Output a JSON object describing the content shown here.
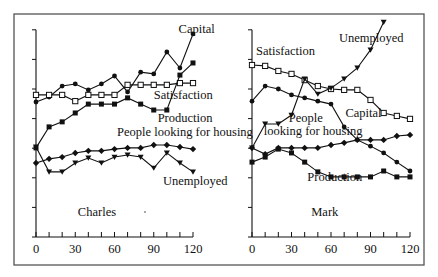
{
  "chart_data": [
    {
      "type": "line",
      "title": "Charles",
      "xlabel": "",
      "ylabel": "",
      "x": [
        0,
        10,
        20,
        30,
        40,
        50,
        60,
        70,
        80,
        90,
        100,
        110,
        120
      ],
      "x_tick_labels": [
        "0",
        "30",
        "60",
        "90",
        "120"
      ],
      "x_tick_values": [
        0,
        30,
        60,
        90,
        120
      ],
      "xlim": [
        0,
        120
      ],
      "ylim": [
        0,
        7
      ],
      "y_tick_labels": [],
      "grid": false,
      "legend": "inline labels",
      "series": [
        {
          "name": "Capital",
          "marker": "filled-circle",
          "values": [
            4.56,
            4.73,
            5.1,
            5.17,
            4.97,
            5.17,
            5.44,
            4.9,
            5.57,
            5.51,
            6.25,
            5.71,
            6.86
          ]
        },
        {
          "name": "Satisfaction",
          "marker": "open-square",
          "values": [
            4.8,
            4.8,
            4.8,
            4.59,
            4.8,
            4.8,
            4.8,
            5.14,
            5.14,
            5.14,
            5.14,
            5.2,
            5.2
          ]
        },
        {
          "name": "Production",
          "marker": "filled-square",
          "values": [
            3.01,
            3.72,
            3.89,
            4.19,
            4.49,
            4.49,
            4.49,
            4.7,
            4.49,
            4.29,
            4.29,
            5.47,
            5.88
          ]
        },
        {
          "name": "People looking for housing",
          "marker": "filled-diamond",
          "values": [
            2.5,
            2.64,
            2.7,
            2.84,
            2.91,
            2.91,
            2.97,
            3.01,
            3.01,
            3.11,
            3.11,
            3.04,
            2.97
          ]
        },
        {
          "name": "Unemployed",
          "marker": "filled-triangle-down",
          "values": [
            3.04,
            2.2,
            2.2,
            2.5,
            2.67,
            2.5,
            2.7,
            2.77,
            2.7,
            2.33,
            2.84,
            2.5,
            2.2
          ]
        }
      ],
      "annotations": [
        {
          "text": "Capital",
          "x": 109,
          "y": 6.9
        },
        {
          "text": "Satisfaction",
          "x": 90,
          "y": 4.65
        },
        {
          "text": "Production",
          "x": 93,
          "y": 3.9
        },
        {
          "text": "People looking for housing",
          "x": 62,
          "y": 3.4
        },
        {
          "text": "Unemployed",
          "x": 97,
          "y": 1.75
        },
        {
          "text": "Charles",
          "x": 32,
          "y": 0.7
        }
      ]
    },
    {
      "type": "line",
      "title": "Mark",
      "xlabel": "",
      "ylabel": "",
      "x": [
        0,
        10,
        20,
        30,
        40,
        50,
        60,
        70,
        80,
        90,
        100,
        110,
        120
      ],
      "x_tick_labels": [
        "0",
        "30",
        "60",
        "90",
        "120"
      ],
      "x_tick_values": [
        0,
        30,
        60,
        90,
        120
      ],
      "xlim": [
        0,
        120
      ],
      "ylim": [
        0,
        7
      ],
      "y_tick_labels": [],
      "grid": false,
      "legend": "inline labels",
      "series": [
        {
          "name": "Satisfaction",
          "marker": "open-square",
          "values": [
            5.81,
            5.78,
            5.61,
            5.51,
            5.3,
            5.1,
            5.0,
            4.97,
            4.97,
            4.63,
            4.19,
            4.09,
            3.99
          ]
        },
        {
          "name": "Capital",
          "marker": "filled-circle",
          "values": [
            4.59,
            5.1,
            5.0,
            4.8,
            4.7,
            4.59,
            4.49,
            3.72,
            3.28,
            3.07,
            2.84,
            2.53,
            2.23
          ]
        },
        {
          "name": "People looking for housing",
          "marker": "filled-diamond",
          "values": [
            3.01,
            2.8,
            3.01,
            3.01,
            3.01,
            3.01,
            3.11,
            3.18,
            3.28,
            3.28,
            3.28,
            3.41,
            3.45
          ]
        },
        {
          "name": "Unemployed",
          "marker": "filled-triangle-down",
          "values": [
            3.01,
            3.82,
            3.82,
            4.12,
            5.34,
            4.83,
            5.03,
            5.34,
            5.71,
            6.32,
            7.26,
            null,
            null
          ]
        },
        {
          "name": "Production",
          "marker": "filled-square",
          "values": [
            2.53,
            2.7,
            2.97,
            2.84,
            2.53,
            2.2,
            2.03,
            2.03,
            2.03,
            2.03,
            2.23,
            2.03,
            2.03
          ]
        }
      ],
      "annotations": [
        {
          "text": "Unemployed",
          "x": 66,
          "y": 6.6
        },
        {
          "text": "Satisfaction",
          "x": 3,
          "y": 6.15
        },
        {
          "text": "People",
          "x": 28,
          "y": 3.9
        },
        {
          "text": "looking for housing",
          "x": 9,
          "y": 3.45
        },
        {
          "text": "Capital",
          "x": 71,
          "y": 4.05
        },
        {
          "text": "Production",
          "x": 42,
          "y": 1.9
        },
        {
          "text": "Mark",
          "x": 45,
          "y": 0.7
        }
      ]
    }
  ],
  "layout": {
    "frame": {
      "x": 14,
      "y": 14,
      "w": 410,
      "h": 251
    },
    "panels": [
      {
        "x0": 36,
        "x1": 193,
        "y0": 237,
        "unit": 29.6,
        "top_tick": 7,
        "stray_dot": [
          145,
          212
        ]
      },
      {
        "x0": 252,
        "x1": 410,
        "y0": 237,
        "unit": 29.6,
        "top_tick": 7
      }
    ],
    "colors": {
      "ink": "#111111",
      "frame": "#555555",
      "background": "#ffffff"
    }
  }
}
